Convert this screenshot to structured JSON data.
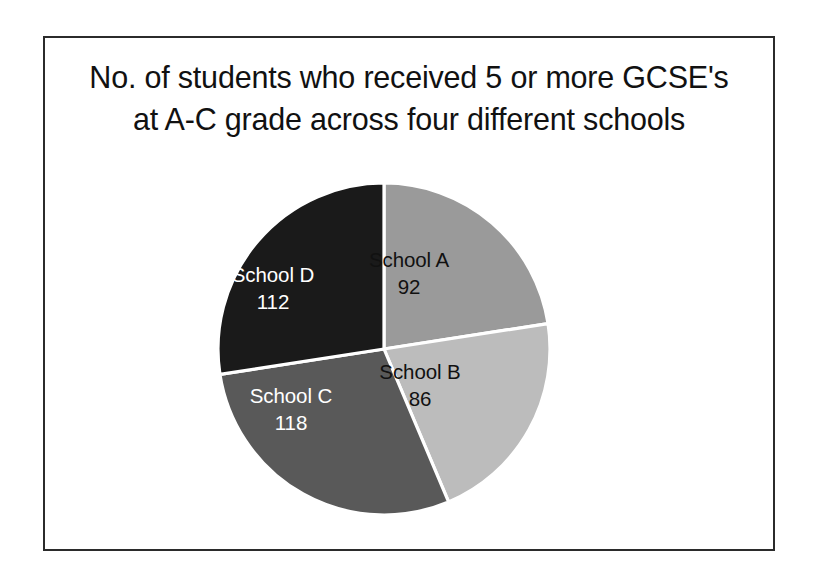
{
  "frame": {
    "border_color": "#2b2b2b",
    "background": "#ffffff"
  },
  "title": {
    "line1": "No. of students who received 5 or more GCSE's",
    "line2": "at A-C grade across four different schools",
    "full": "No. of students who received 5 or more GCSE's at A-C grade across four different schools",
    "color": "#111111"
  },
  "chart_data": {
    "type": "pie",
    "title": "No. of students who received 5 or more GCSE's at A-C grade across four different schools",
    "xlabel": "",
    "ylabel": "",
    "categories": [
      "School A",
      "School B",
      "School C",
      "School D"
    ],
    "values": [
      92,
      86,
      118,
      112
    ],
    "total": 408,
    "slices": [
      {
        "label": "School A",
        "value": 92,
        "value_text": "92",
        "percent": 22.5,
        "start_angle_deg": 0.0,
        "end_angle_deg": 81.2,
        "color": "#9a9a9a",
        "text_color": "#111111"
      },
      {
        "label": "School B",
        "value": 86,
        "value_text": "86",
        "percent": 21.1,
        "start_angle_deg": 81.2,
        "end_angle_deg": 157.1,
        "color": "#bcbcbc",
        "text_color": "#111111"
      },
      {
        "label": "School C",
        "value": 118,
        "value_text": "118",
        "percent": 28.9,
        "start_angle_deg": 157.1,
        "end_angle_deg": 261.2,
        "color": "#595959",
        "text_color": "#ffffff"
      },
      {
        "label": "School D",
        "value": 112,
        "value_text": "112",
        "percent": 27.5,
        "start_angle_deg": 261.2,
        "end_angle_deg": 360.0,
        "color": "#1a1a1a",
        "text_color": "#ffffff"
      }
    ],
    "start_angle": "12 o'clock",
    "direction": "clockwise",
    "divider_color": "#ffffff",
    "legend": "none (labels drawn inside slices)",
    "grid": false,
    "labels_show_name_and_value": true
  }
}
